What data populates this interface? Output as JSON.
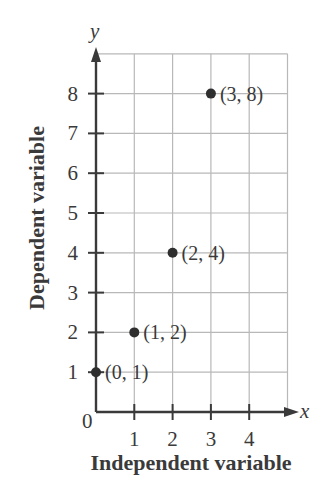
{
  "chart_data": {
    "type": "scatter",
    "title": "",
    "xlabel": "Independent variable",
    "ylabel": "Dependent variable",
    "x_axis_name": "x",
    "y_axis_name": "y",
    "origin_label": "0",
    "xlim": [
      0,
      5
    ],
    "ylim": [
      0,
      9
    ],
    "xticks": [
      1,
      2,
      3,
      4
    ],
    "yticks": [
      1,
      2,
      3,
      4,
      5,
      6,
      7,
      8
    ],
    "grid": true,
    "legend": null,
    "points": [
      {
        "x": 0,
        "y": 1,
        "label": "(0, 1)"
      },
      {
        "x": 1,
        "y": 2,
        "label": "(1, 2)"
      },
      {
        "x": 2,
        "y": 4,
        "label": "(2, 4)"
      },
      {
        "x": 3,
        "y": 8,
        "label": "(3, 8)"
      }
    ],
    "colors": {
      "axis": "#3a3a3a",
      "grid": "#b8b8b8",
      "point": "#2e2e2e",
      "text": "#3a3a3a"
    }
  }
}
